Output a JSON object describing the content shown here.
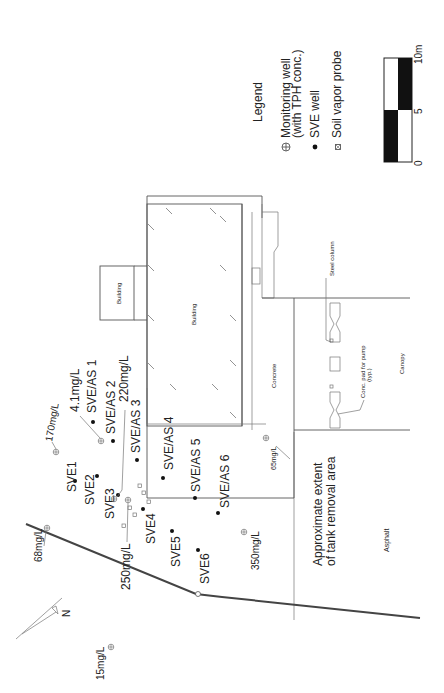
{
  "legend": {
    "title": "Legend",
    "monitoring_well_line1": "Monitoring well",
    "monitoring_well_line2": "(with TPH conc.)",
    "sve_well": "SVE well",
    "soil_vapor_probe": "Soil vapor probe"
  },
  "scale_bar": {
    "tick_0": "0",
    "tick_5": "5",
    "tick_10": "10m"
  },
  "north_arrow": {
    "label": "N"
  },
  "areas": {
    "building_small": "Building",
    "building_main": "Building",
    "concrete": "Concrete",
    "canopy": "Canopy",
    "asphalt": "Asphalt",
    "steel_column": "Steel column",
    "pump_pad_line1": "Conc. pad for pump",
    "pump_pad_line2": "(typ.)",
    "tank_removal_line1": "Approximate extent",
    "tank_removal_line2": "of tank removal area"
  },
  "sve_wells": [
    {
      "label": "SVE1"
    },
    {
      "label": "SVE2"
    },
    {
      "label": "SVE3"
    },
    {
      "label": "SVE4"
    },
    {
      "label": "SVE5"
    },
    {
      "label": "SVE6"
    }
  ],
  "sve_as_wells": [
    {
      "label": "SVE/AS 1"
    },
    {
      "label": "SVE/AS 2"
    },
    {
      "label": "SVE/AS 3"
    },
    {
      "label": "SVE/AS 4"
    },
    {
      "label": "SVE/AS 5"
    },
    {
      "label": "SVE/AS 6"
    }
  ],
  "monitoring_wells": [
    {
      "conc": "4.1mg/L"
    },
    {
      "conc": "170mg/L"
    },
    {
      "conc": "220mg/L"
    },
    {
      "conc": "250mg/L"
    },
    {
      "conc": "68mg/L"
    },
    {
      "conc": "15mg/L"
    },
    {
      "conc": "65mg/L"
    },
    {
      "conc": "350mg/L"
    }
  ]
}
